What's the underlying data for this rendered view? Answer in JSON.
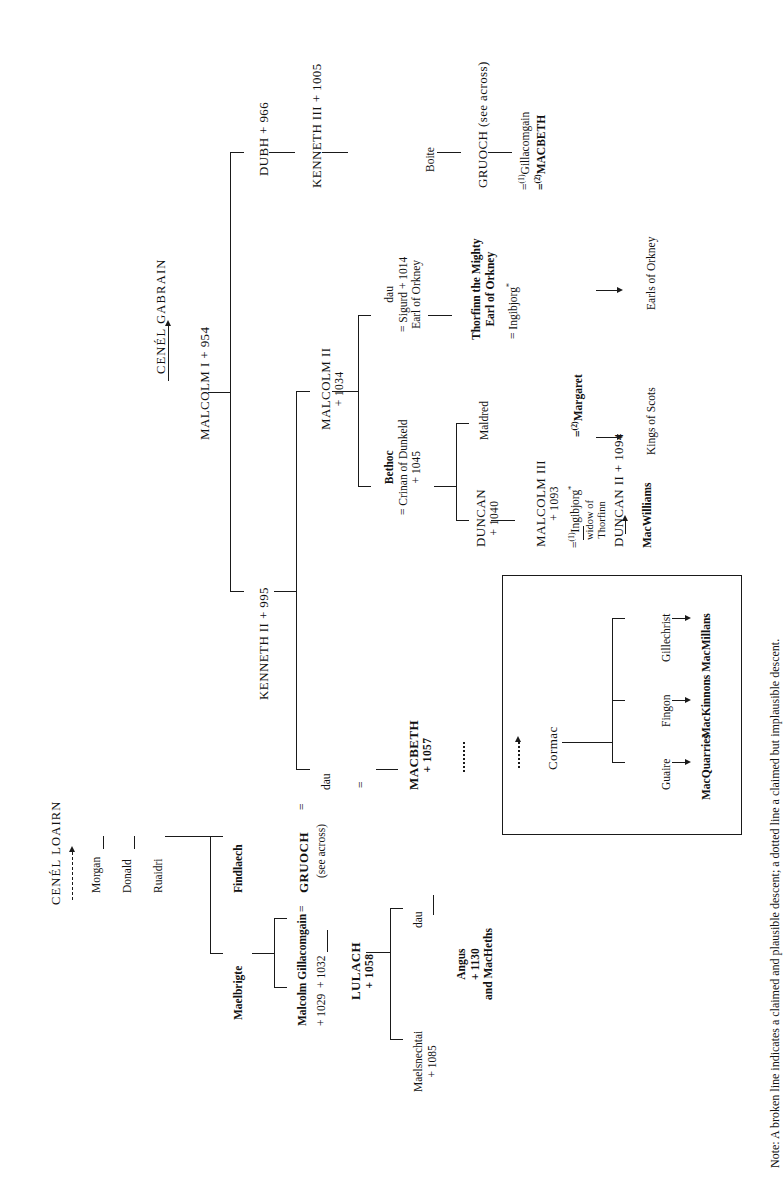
{
  "document": {
    "type": "genealogical-family-tree",
    "orientation": "rotated-90-counterclockwise",
    "note": "Note: A broken line indicates a claimed and plausible descent; a dotted line a claimed but implausible descent."
  },
  "headings": {
    "gabrain": "CENÉL GABRAIN",
    "loairn": "CENÉL LOAIRN"
  },
  "gabrain_line": {
    "malcolm_i": "MALCOLM I + 954",
    "dubh": "DUBH + 966",
    "kenneth_ii": "KENNETH II + 995",
    "kenneth_iii": "KENNETH III + 1005",
    "boite": "Boite",
    "gruoch": "GRUOCH (see across)",
    "gruoch_m1": "Gillacomgain",
    "gruoch_m2": "MACBETH",
    "malcolm_ii_name": "MALCOLM II",
    "malcolm_ii_date": "+ 1034",
    "dau": "dau",
    "dau_sp_1": "= Sigurd + 1014",
    "dau_sp_2": "Earl of Orkney",
    "bethoc": "Bethoc",
    "bethoc_sp": "= Crinan of Dunkeld",
    "crinan_date": "+ 1045",
    "thorfinn_1": "Thorfinn the Mighty",
    "thorfinn_2": "Earl of Orkney",
    "thorfinn_sp": "= Ingibjorg",
    "duncan_i_name": "DUNCAN",
    "duncan_i_date": "+ 1040",
    "maldred": "Maldred",
    "malcolm_iii_name": "MALCOLM III",
    "malcolm_iii_date": "+ 1093",
    "malcolm_iii_m1": "Ingibjorg",
    "malcolm_iii_m1_note1": "widow of",
    "malcolm_iii_m1_note2": "Thorfinn",
    "malcolm_iii_m2": "Margaret",
    "duncan_ii": "DUNCAN II + 1094",
    "macwilliams": "MacWilliams",
    "kings_of_scots": "Kings of Scots",
    "earls_of_orkney": "Earls of Orkney",
    "dau_of_kenneth": "dau",
    "macbeth_name": "MACBETH",
    "macbeth_date": "+ 1057"
  },
  "loairn_line": {
    "morgan": "Morgan",
    "donald": "Donald",
    "ruaidri": "Ruaidri",
    "findlaech": "Findlaech",
    "maelbrigte": "Maelbrigte",
    "malcolm": "Malcolm",
    "gillacomgain": "Gillacomgain",
    "malcolm_date": "+ 1029",
    "gillacomgain_date": "+ 1032",
    "equals": "=",
    "gruoch": "GRUOCH",
    "see_across": "(see across)",
    "lulach_name": "LULACH",
    "lulach_date": "+ 1058",
    "maelsnechtai": "Maelsnechtai",
    "maelsnechtai_date": "+ 1085",
    "dau": "dau",
    "angus": "Angus",
    "angus_date": "+ 1130",
    "macheths": "and MacHeths"
  },
  "cormac_box": {
    "cormac": "Cormac",
    "children": [
      {
        "name": "Guaire",
        "descendants": "MacQuarries"
      },
      {
        "name": "Fingon",
        "descendants": "MacKinnons"
      },
      {
        "name": "Gillechrist",
        "descendants": "MacMillans"
      }
    ]
  },
  "marriage_markers": {
    "first": "(1)",
    "second": "(2)",
    "asterisk": "*"
  },
  "colors": {
    "ink": "#1a1a1a",
    "background": "#ffffff"
  }
}
